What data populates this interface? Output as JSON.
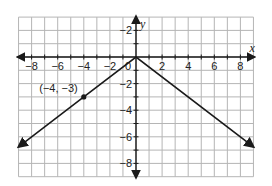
{
  "chart_data": {
    "type": "line",
    "title": "",
    "xlabel": "x",
    "ylabel": "y",
    "xlim": [
      -9,
      9
    ],
    "ylim": [
      -9,
      3
    ],
    "grid": true,
    "grid_step": 1,
    "x_ticks": [
      -8,
      -6,
      -4,
      -2,
      0,
      2,
      4,
      6,
      8
    ],
    "x_tick_labels": [
      "−8",
      "−6",
      "−4",
      "−2",
      "0",
      "2",
      "4",
      "6",
      "8"
    ],
    "y_ticks": [
      2,
      -2,
      -4,
      -6,
      -8
    ],
    "y_tick_labels": [
      "−2",
      "−2",
      "−4",
      "−6",
      "−8"
    ],
    "series": [
      {
        "name": "y = -3/4|x|",
        "x": [
          -9,
          -4,
          0,
          9
        ],
        "y": [
          -6.75,
          -3,
          0,
          -6.75
        ],
        "arrows_at_ends": true,
        "color": "#1a1a1a"
      }
    ],
    "points": [
      {
        "x": -4,
        "y": -3,
        "label": "(−4, −3)"
      }
    ],
    "legend": null
  },
  "colors": {
    "grid": "#b5b5b5",
    "axis": "#1a1a1a",
    "line": "#1a1a1a",
    "background": "#ffffff"
  }
}
